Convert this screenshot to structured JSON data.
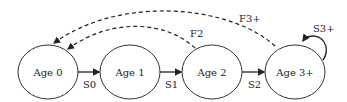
{
  "diagram": {
    "type": "state-transition",
    "nodes": [
      {
        "id": "age0",
        "label": "Age 0"
      },
      {
        "id": "age1",
        "label": "Age 1"
      },
      {
        "id": "age2",
        "label": "Age 2"
      },
      {
        "id": "age3",
        "label": "Age 3+"
      }
    ],
    "edges": [
      {
        "from": "age0",
        "to": "age1",
        "label": "S0",
        "style": "solid"
      },
      {
        "from": "age1",
        "to": "age2",
        "label": "S1",
        "style": "solid"
      },
      {
        "from": "age2",
        "to": "age3",
        "label": "S2",
        "style": "solid"
      },
      {
        "from": "age3",
        "to": "age3",
        "label": "S3+",
        "style": "solid"
      },
      {
        "from": "age2",
        "to": "age0",
        "label": "F2",
        "style": "dashed"
      },
      {
        "from": "age3",
        "to": "age0",
        "label": "F3+",
        "style": "dashed"
      }
    ],
    "stroke_color": "#222222"
  }
}
